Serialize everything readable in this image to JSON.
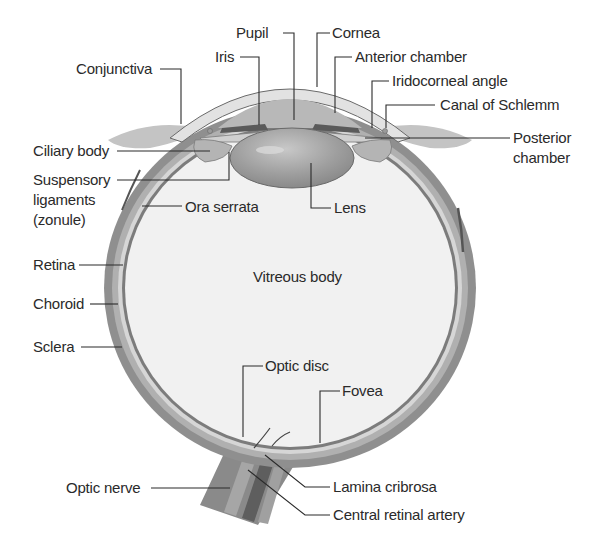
{
  "diagram": {
    "colors": {
      "sclera": "#8f8f8f",
      "choroid": "#a8a8a8",
      "retina_gap": "#d2d2d2",
      "vitreous": "#f0f0f0",
      "lens": "#a0a0a0",
      "cornea_fill": "#e6e6e6",
      "iris": "#9a9a9a",
      "conjunctiva": "#c4c4c4",
      "line": "#2a2a2a",
      "text": "#2a2a2a"
    },
    "labels": {
      "pupil": "Pupil",
      "iris": "Iris",
      "cornea": "Cornea",
      "anterior_chamber": "Anterior chamber",
      "conjunctiva": "Conjunctiva",
      "iridocorneal_angle": "Iridocorneal angle",
      "canal_of_schlemm": "Canal of Schlemm",
      "posterior_chamber_1": "Posterior",
      "posterior_chamber_2": "chamber",
      "ciliary_body": "Ciliary body",
      "suspensory_1": "Suspensory",
      "suspensory_2": "ligaments",
      "suspensory_3": "(zonule)",
      "ora_serrata": "Ora serrata",
      "lens": "Lens",
      "retina": "Retina",
      "vitreous_body": "Vitreous body",
      "choroid": "Choroid",
      "sclera": "Sclera",
      "optic_disc": "Optic disc",
      "fovea": "Fovea",
      "optic_nerve": "Optic nerve",
      "lamina_cribrosa": "Lamina cribrosa",
      "central_retinal_artery": "Central retinal artery"
    }
  }
}
